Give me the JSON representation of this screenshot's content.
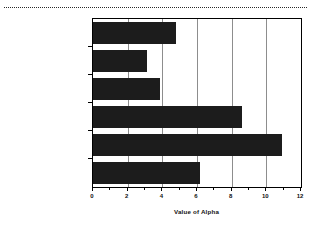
{
  "chart_data": {
    "type": "bar",
    "orientation": "horizontal",
    "title": "",
    "xlabel": "Value of Alpha",
    "ylabel": "",
    "xlim": [
      0,
      12
    ],
    "grid": true,
    "legend": false,
    "categories": [
      "4A. Stream (logged)",
      "4B. Overlook (undist)",
      "1A. Base (natural distrb)",
      "1B. BC WASH (undist)",
      "2. Lakecamp (undist)",
      "3. Summit (undist)"
    ],
    "category_sublabels": [
      "200m",
      "205m",
      "250m",
      "300m",
      "1180m",
      "1830m"
    ],
    "values": [
      4.8,
      3.1,
      3.85,
      8.6,
      10.9,
      6.2
    ],
    "xticks_major": [
      0,
      2,
      4,
      6,
      8,
      10,
      12
    ],
    "xticks_major_labels": [
      "0",
      "2",
      "4",
      "6",
      "8",
      "10",
      "12"
    ],
    "xticks_minor": [
      1,
      3,
      5,
      7,
      9,
      11
    ],
    "bar_color": "#1c1c1c",
    "grid_color": "#8d8d8d",
    "axis_color": "#000000"
  }
}
